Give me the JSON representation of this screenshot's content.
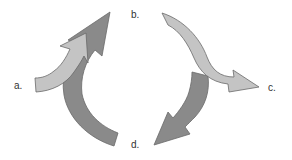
{
  "diagram": {
    "type": "cycle",
    "labels": {
      "a": "a.",
      "b": "b.",
      "c": "c.",
      "d": "d."
    },
    "arrows": [
      {
        "id": "a-to-b",
        "from": "a",
        "to": "b",
        "shade": "light"
      },
      {
        "id": "d-to-b",
        "from": "d",
        "to": "b",
        "shade": "dark"
      },
      {
        "id": "b-to-c",
        "from": "b",
        "to": "c",
        "shade": "light"
      },
      {
        "id": "c-to-d",
        "from": "c",
        "to": "d",
        "shade": "dark"
      }
    ],
    "colors": {
      "light_fill": "#c4c4c4",
      "dark_fill": "#8a8a8a",
      "stroke": "#6a6a6a",
      "label": "#333333",
      "background": "#ffffff"
    }
  }
}
